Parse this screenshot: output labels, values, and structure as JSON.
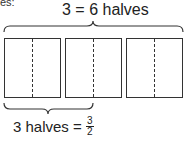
{
  "clipped_text": "es:",
  "top_brace_label": "3 = 6 halves",
  "bottom_brace_label": {
    "text": "3 halves =",
    "fraction": {
      "numerator": "3",
      "denominator": "2"
    }
  },
  "wholes": [
    {
      "index": 1,
      "parts": 2
    },
    {
      "index": 2,
      "parts": 2
    },
    {
      "index": 3,
      "parts": 2
    }
  ],
  "colors": {
    "stroke": "#333333",
    "background": "#ffffff"
  }
}
